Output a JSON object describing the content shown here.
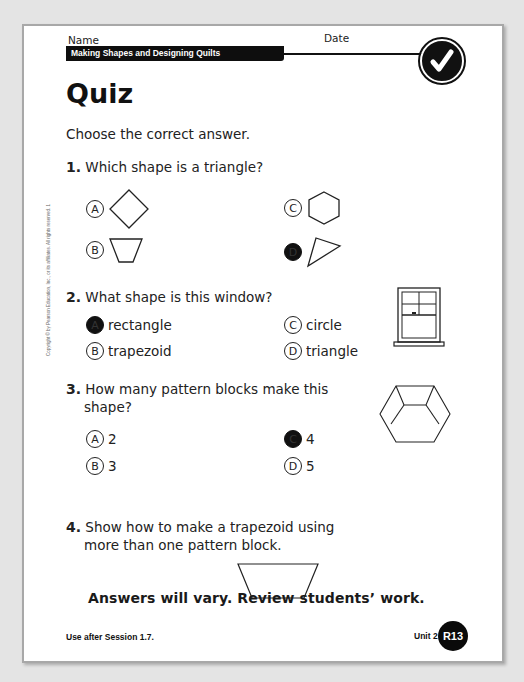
{
  "header": {
    "name_label": "Name",
    "date_label": "Date",
    "unit_banner": "Making Shapes and Designing Quilts",
    "badge_icon": "checkmark-icon"
  },
  "title": "Quiz",
  "instructions": "Choose the correct answer.",
  "questions": [
    {
      "number": "1.",
      "text": "Which shape is a triangle?",
      "options": [
        {
          "letter": "A",
          "label": "",
          "shape": "diamond",
          "selected": false
        },
        {
          "letter": "B",
          "label": "",
          "shape": "trapezoid",
          "selected": false
        },
        {
          "letter": "C",
          "label": "",
          "shape": "hexagon",
          "selected": false
        },
        {
          "letter": "D",
          "label": "",
          "shape": "triangle",
          "selected": true
        }
      ]
    },
    {
      "number": "2.",
      "text": "What shape is this window?",
      "image": "window-illustration",
      "options": [
        {
          "letter": "A",
          "label": "rectangle",
          "selected": true
        },
        {
          "letter": "B",
          "label": "trapezoid",
          "selected": false
        },
        {
          "letter": "C",
          "label": "circle",
          "selected": false
        },
        {
          "letter": "D",
          "label": "triangle",
          "selected": false
        }
      ]
    },
    {
      "number": "3.",
      "text_line1": "How many pattern blocks make this",
      "text_line2": "shape?",
      "image": "hexagon-pattern-blocks",
      "options": [
        {
          "letter": "A",
          "label": "2",
          "selected": false
        },
        {
          "letter": "B",
          "label": "3",
          "selected": false
        },
        {
          "letter": "C",
          "label": "4",
          "selected": true
        },
        {
          "letter": "D",
          "label": "5",
          "selected": false
        }
      ]
    },
    {
      "number": "4.",
      "text_line1": "Show how to make a trapezoid using",
      "text_line2": "more than one pattern block.",
      "image": "trapezoid-outline"
    }
  ],
  "answer_note": "Answers will vary. Review students’ work.",
  "footer": {
    "session": "Use after Session 1.7.",
    "unit": "Unit 2",
    "page": "R13"
  },
  "copyright": "Copyright © by Pearson Education, Inc., or its affiliates. All rights reserved. 1",
  "colors": {
    "ink": "#111111",
    "paper": "#ffffff",
    "background": "#e4e4e4",
    "frame": "#a8a8a8"
  }
}
